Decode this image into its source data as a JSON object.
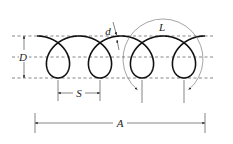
{
  "diagram": {
    "labels": {
      "D": "D",
      "d": "d",
      "L": "L",
      "S": "S",
      "A": "A"
    },
    "label_meanings": {
      "D": "coil diameter",
      "d": "wire diameter",
      "L": "length of one coil turn",
      "S": "pitch",
      "A": "overall length"
    },
    "colors": {
      "coil": "#111111",
      "guides": "#555555",
      "dimensions": "#333333",
      "background": "#ffffff"
    },
    "geometry": {
      "guide_lines_y": [
        36,
        57,
        78
      ],
      "guide_x_range": [
        12,
        214
      ],
      "coil_start_x": 37,
      "coil_center_y": 57,
      "coil_radius": 21,
      "pitch_px": 42,
      "turns": 4,
      "loop_bottom_x": [
        58,
        100,
        142,
        184
      ],
      "S_dim": {
        "x1": 58,
        "x2": 100,
        "y": 93
      },
      "A_dim": {
        "x1": 35,
        "x2": 205,
        "y": 123
      },
      "D_dim": {
        "x": 24,
        "y1": 36,
        "y2": 78
      },
      "L_arc": {
        "cx": 163,
        "cy": 59,
        "r": 40
      }
    }
  }
}
